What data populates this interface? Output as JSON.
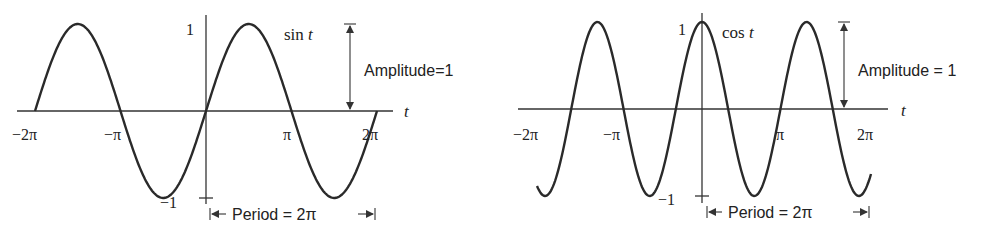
{
  "chart_data": [
    {
      "type": "line",
      "title": "sin t",
      "xlabel": "t",
      "ylabel": "",
      "x_ticks": [
        "−2π",
        "−π",
        "π",
        "2π"
      ],
      "y_ticks": [
        "1",
        "−1"
      ],
      "xlim": [
        -6.2832,
        6.2832
      ],
      "ylim": [
        -1,
        1
      ],
      "grid": false,
      "series": [
        {
          "name": "sin t",
          "x": [
            -6.2832,
            -4.7124,
            -3.1416,
            -1.5708,
            0,
            1.5708,
            3.1416,
            4.7124,
            6.2832
          ],
          "values": [
            0,
            1,
            0,
            -1,
            0,
            1,
            0,
            -1,
            0
          ]
        }
      ],
      "annotations": {
        "curve_label": "sin t",
        "amplitude": "Amplitude=1",
        "period": "Period = 2π"
      }
    },
    {
      "type": "line",
      "title": "cos t",
      "xlabel": "t",
      "ylabel": "",
      "x_ticks": [
        "−2π",
        "−π",
        "π",
        "2π"
      ],
      "y_ticks": [
        "1",
        "−1"
      ],
      "xlim": [
        -6.2832,
        6.2832
      ],
      "ylim": [
        -1,
        1
      ],
      "grid": false,
      "series": [
        {
          "name": "cos t",
          "x": [
            -6.2832,
            -3.1416,
            0,
            3.1416,
            6.2832
          ],
          "values": [
            1,
            -1,
            1,
            -1,
            1
          ]
        }
      ],
      "annotations": {
        "curve_label": "cos t",
        "amplitude": "Amplitude = 1",
        "period": "Period = 2π"
      }
    }
  ],
  "sin_plot": {
    "y_tick_top": "1",
    "y_tick_bottom": "−1",
    "x_axis_label": "t",
    "x_ticks": [
      "−2π",
      "−π",
      "π",
      "2π"
    ],
    "curve_label_fn": "sin",
    "curve_label_var": "t",
    "amplitude_label": "Amplitude=1",
    "period_label": "Period = 2π"
  },
  "cos_plot": {
    "y_tick_top": "1",
    "y_tick_bottom": "−1",
    "x_axis_label": "t",
    "x_ticks": [
      "−2π",
      "−π",
      "π",
      "2π"
    ],
    "curve_label_fn": "cos",
    "curve_label_var": "t",
    "amplitude_label": "Amplitude = 1",
    "period_label": "Period = 2π"
  }
}
